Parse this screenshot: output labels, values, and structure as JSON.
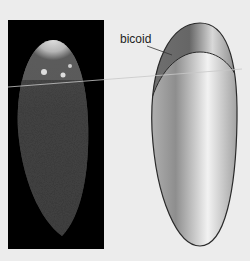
{
  "figure": {
    "label": "bicoid",
    "colors": {
      "background": "#ececec",
      "micrograph_bg": "#000000",
      "outline": "#2a2a2a",
      "section_line": "#c8c8c8"
    },
    "panels": [
      {
        "name": "micrograph",
        "description": "fluorescence image of embryo with bright anterior region"
      },
      {
        "name": "schematic",
        "description": "embryo outline with bicoid anterior domain shaded"
      }
    ]
  }
}
